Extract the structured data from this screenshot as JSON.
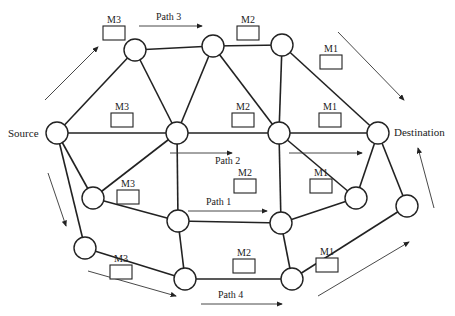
{
  "diagram": {
    "type": "network-graph",
    "nodes": [
      {
        "id": "source",
        "label": "Source"
      },
      {
        "id": "t1",
        "label": ""
      },
      {
        "id": "t2",
        "label": ""
      },
      {
        "id": "t3",
        "label": ""
      },
      {
        "id": "dest",
        "label": "Destination"
      },
      {
        "id": "m1",
        "label": ""
      },
      {
        "id": "m2",
        "label": ""
      },
      {
        "id": "a",
        "label": ""
      },
      {
        "id": "b",
        "label": ""
      },
      {
        "id": "c",
        "label": ""
      },
      {
        "id": "d",
        "label": ""
      },
      {
        "id": "e",
        "label": ""
      },
      {
        "id": "f",
        "label": ""
      },
      {
        "id": "g",
        "label": ""
      },
      {
        "id": "h",
        "label": ""
      }
    ],
    "edges": [
      [
        "source",
        "t1"
      ],
      [
        "source",
        "m1"
      ],
      [
        "source",
        "a"
      ],
      [
        "source",
        "e"
      ],
      [
        "t1",
        "t2"
      ],
      [
        "t1",
        "m1"
      ],
      [
        "t2",
        "t3"
      ],
      [
        "t2",
        "m1"
      ],
      [
        "t2",
        "m2"
      ],
      [
        "t3",
        "m2"
      ],
      [
        "t3",
        "dest"
      ],
      [
        "m1",
        "m2"
      ],
      [
        "m2",
        "dest"
      ],
      [
        "m1",
        "a"
      ],
      [
        "m1",
        "b"
      ],
      [
        "m2",
        "c"
      ],
      [
        "m2",
        "d"
      ],
      [
        "a",
        "b"
      ],
      [
        "b",
        "c"
      ],
      [
        "c",
        "d"
      ],
      [
        "d",
        "dest"
      ],
      [
        "dest",
        "h"
      ],
      [
        "b",
        "f"
      ],
      [
        "c",
        "g"
      ],
      [
        "e",
        "f"
      ],
      [
        "f",
        "g"
      ],
      [
        "g",
        "h"
      ]
    ],
    "modules": [
      {
        "label": "M3"
      },
      {
        "label": "M2"
      },
      {
        "label": "M1"
      },
      {
        "label": "M3"
      },
      {
        "label": "M2"
      },
      {
        "label": "M1"
      },
      {
        "label": "M3"
      },
      {
        "label": "M2"
      },
      {
        "label": "M1"
      },
      {
        "label": "M3"
      },
      {
        "label": "M2"
      },
      {
        "label": "M1"
      }
    ],
    "paths": [
      {
        "label": "Path 3"
      },
      {
        "label": "Path 2"
      },
      {
        "label": "Path 1"
      },
      {
        "label": "Path 4"
      }
    ]
  }
}
